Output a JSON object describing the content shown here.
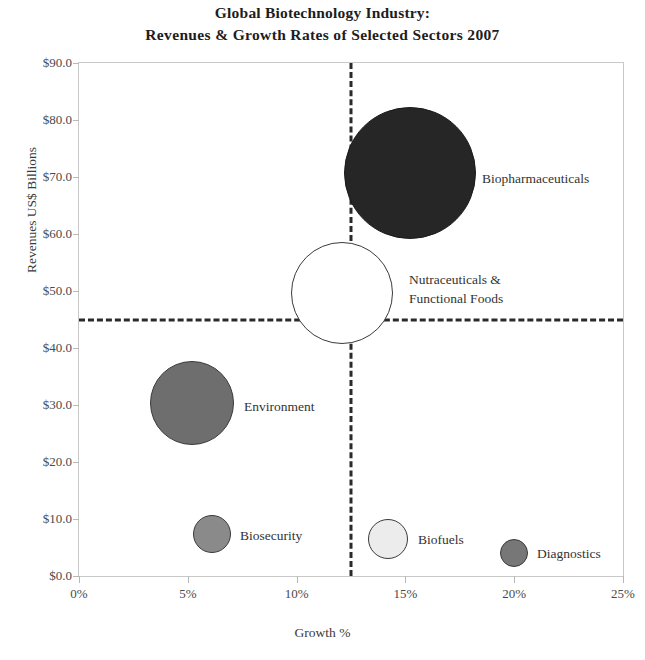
{
  "chart_data": {
    "type": "scatter",
    "title": "Global Biotechnology Industry:\nRevenues & Growth Rates of Selected Sectors 2007",
    "title_line1": "Global Biotechnology Industry:",
    "title_line2": "Revenues & Growth Rates of Selected Sectors 2007",
    "xlabel": "Growth %",
    "ylabel": "Revenues US$ Billions",
    "xlim": [
      0,
      25
    ],
    "ylim": [
      0,
      90
    ],
    "xticks": [
      "0%",
      "5%",
      "10%",
      "15%",
      "20%",
      "25%"
    ],
    "xtick_values": [
      0,
      5,
      10,
      15,
      20,
      25
    ],
    "yticks": [
      "$0.0",
      "$10.0",
      "$20.0",
      "$30.0",
      "$40.0",
      "$50.0",
      "$60.0",
      "$70.0",
      "$80.0",
      "$90.0"
    ],
    "ytick_values": [
      0,
      10,
      20,
      30,
      40,
      50,
      60,
      70,
      80,
      90
    ],
    "grid": false,
    "legend": "none",
    "quadrant_lines": {
      "vertical_x": 12.5,
      "horizontal_y": 45,
      "style": "dashed",
      "color": "#2a2a2a"
    },
    "bubbles": [
      {
        "name": "Biopharmaceuticals",
        "x": 15.2,
        "y": 70.7,
        "radius_px": 66,
        "fill": "#262626",
        "stroke": "#1a1a1a",
        "label": "Biopharmaceuticals",
        "label_x": 481,
        "label_y": 177
      },
      {
        "name": "Nutraceuticals & Functional Foods",
        "x": 12.1,
        "y": 49.7,
        "radius_px": 51,
        "fill": "#ffffff",
        "stroke": "#3a3a3a",
        "label": "Nutraceuticals &\nFunctional Foods",
        "label_x": 408,
        "label_y": 288
      },
      {
        "name": "Environment",
        "x": 5.2,
        "y": 30.4,
        "radius_px": 42,
        "fill": "#6e6e6e",
        "stroke": "#3a3a3a",
        "label": "Environment",
        "label_x": 243,
        "label_y": 405
      },
      {
        "name": "Biosecurity",
        "x": 6.1,
        "y": 7.4,
        "radius_px": 19,
        "fill": "#8a8a8a",
        "stroke": "#3a3a3a",
        "label": "Biosecurity",
        "label_x": 239,
        "label_y": 534
      },
      {
        "name": "Biofuels",
        "x": 14.2,
        "y": 6.5,
        "radius_px": 20,
        "fill": "#ececec",
        "stroke": "#3a3a3a",
        "label": "Biofuels",
        "label_x": 417,
        "label_y": 538
      },
      {
        "name": "Diagnostics",
        "x": 20.0,
        "y": 4.0,
        "radius_px": 14,
        "fill": "#777777",
        "stroke": "#3a3a3a",
        "label": "Diagnostics",
        "label_x": 536,
        "label_y": 552
      }
    ]
  }
}
